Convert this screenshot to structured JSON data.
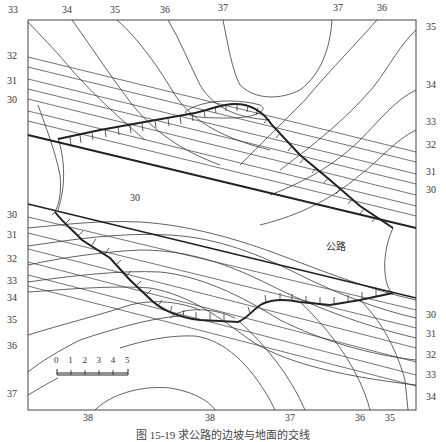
{
  "figure": {
    "caption": "图 15-19  求公路的边坡与地面的交线",
    "road_label": "公路",
    "area_label": "30",
    "labels_top": [
      {
        "text": "33",
        "x": 8,
        "y": 5
      },
      {
        "text": "34",
        "x": 62,
        "y": 5
      },
      {
        "text": "35",
        "x": 110,
        "y": 5
      },
      {
        "text": "36",
        "x": 160,
        "y": 5
      },
      {
        "text": "37",
        "x": 218,
        "y": 3
      },
      {
        "text": "37",
        "x": 333,
        "y": 3
      },
      {
        "text": "36",
        "x": 377,
        "y": 3
      }
    ],
    "labels_left": [
      {
        "text": "32",
        "x": 7,
        "y": 51
      },
      {
        "text": "31",
        "x": 7,
        "y": 76
      },
      {
        "text": "30",
        "x": 7,
        "y": 95
      },
      {
        "text": "30",
        "x": 7,
        "y": 210
      },
      {
        "text": "31",
        "x": 7,
        "y": 230
      },
      {
        "text": "32",
        "x": 7,
        "y": 254
      },
      {
        "text": "33",
        "x": 7,
        "y": 276
      },
      {
        "text": "34",
        "x": 7,
        "y": 293
      },
      {
        "text": "35",
        "x": 7,
        "y": 315
      },
      {
        "text": "36",
        "x": 7,
        "y": 341
      },
      {
        "text": "37",
        "x": 7,
        "y": 389
      }
    ],
    "labels_right": [
      {
        "text": "35",
        "x": 426,
        "y": 22
      },
      {
        "text": "34",
        "x": 426,
        "y": 80
      },
      {
        "text": "33",
        "x": 426,
        "y": 117
      },
      {
        "text": "32",
        "x": 426,
        "y": 140
      },
      {
        "text": "31",
        "x": 426,
        "y": 167
      },
      {
        "text": "30",
        "x": 426,
        "y": 185
      },
      {
        "text": "30",
        "x": 426,
        "y": 310
      },
      {
        "text": "31",
        "x": 426,
        "y": 329
      },
      {
        "text": "32",
        "x": 426,
        "y": 350
      },
      {
        "text": "33",
        "x": 426,
        "y": 370
      },
      {
        "text": "34",
        "x": 426,
        "y": 392
      }
    ],
    "labels_bottom": [
      {
        "text": "38",
        "x": 83,
        "y": 411
      },
      {
        "text": "38",
        "x": 205,
        "y": 411
      },
      {
        "text": "37",
        "x": 285,
        "y": 411
      },
      {
        "text": "36",
        "x": 355,
        "y": 411
      },
      {
        "text": "35",
        "x": 385,
        "y": 411
      }
    ],
    "scale_bar": {
      "ticks": [
        "0",
        "1",
        "2",
        "3",
        "4",
        "5"
      ]
    },
    "colors": {
      "line": "#333333",
      "road_edge": "#222222",
      "frame": "#444444"
    }
  }
}
